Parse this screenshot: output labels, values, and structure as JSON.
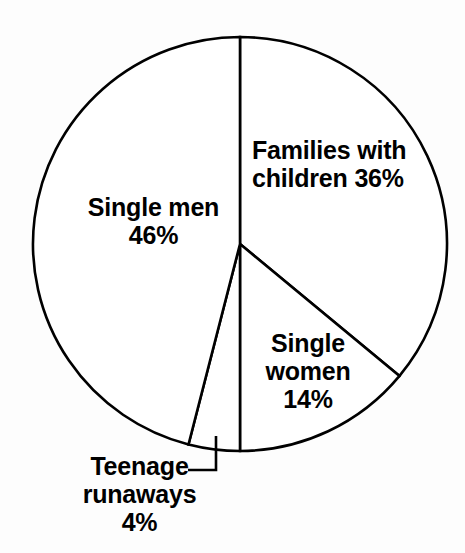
{
  "chart_data": {
    "type": "pie",
    "title": "",
    "subtitle": "",
    "xlabel": "",
    "ylabel": "",
    "legend_position": "none",
    "grid": false,
    "start_angle_deg": 0,
    "direction": "clockwise",
    "categories": [
      "Families with children",
      "Single women",
      "Teenage runaways",
      "Single men"
    ],
    "values": [
      36,
      14,
      4,
      46
    ],
    "units": "%",
    "slices": [
      {
        "name": "families-with-children",
        "label_line1": "Families with",
        "label_line2": "children 36%",
        "value": 36,
        "value_text": "36%",
        "start_deg": 0,
        "end_deg": 129.6,
        "fill": "#ffffff",
        "stroke": "#000000"
      },
      {
        "name": "single-women",
        "label_line1": "Single",
        "label_line2": "women",
        "label_line3": "14%",
        "value": 14,
        "value_text": "14%",
        "start_deg": 129.6,
        "end_deg": 180.0,
        "fill": "#ffffff",
        "stroke": "#000000"
      },
      {
        "name": "teenage-runaways",
        "label_line1": "Teenage",
        "label_line2": "runaways",
        "label_line3": "4%",
        "value": 4,
        "value_text": "4%",
        "start_deg": 180.0,
        "end_deg": 194.4,
        "fill": "#ffffff",
        "stroke": "#000000"
      },
      {
        "name": "single-men",
        "label_line1": "Single men",
        "label_line2": "46%",
        "value": 46,
        "value_text": "46%",
        "start_deg": 194.4,
        "end_deg": 360.0,
        "fill": "#ffffff",
        "stroke": "#000000"
      }
    ],
    "annotations": [
      {
        "name": "teenage-runaways-leader",
        "type": "leader-line",
        "for": "teenage-runaways"
      }
    ],
    "geometry": {
      "center_x": 240,
      "center_y": 244,
      "radius": 207
    },
    "colors": {
      "background": "#fdfdfd",
      "outline": "#000000",
      "text": "#000000",
      "slice_fill": "#ffffff"
    }
  }
}
